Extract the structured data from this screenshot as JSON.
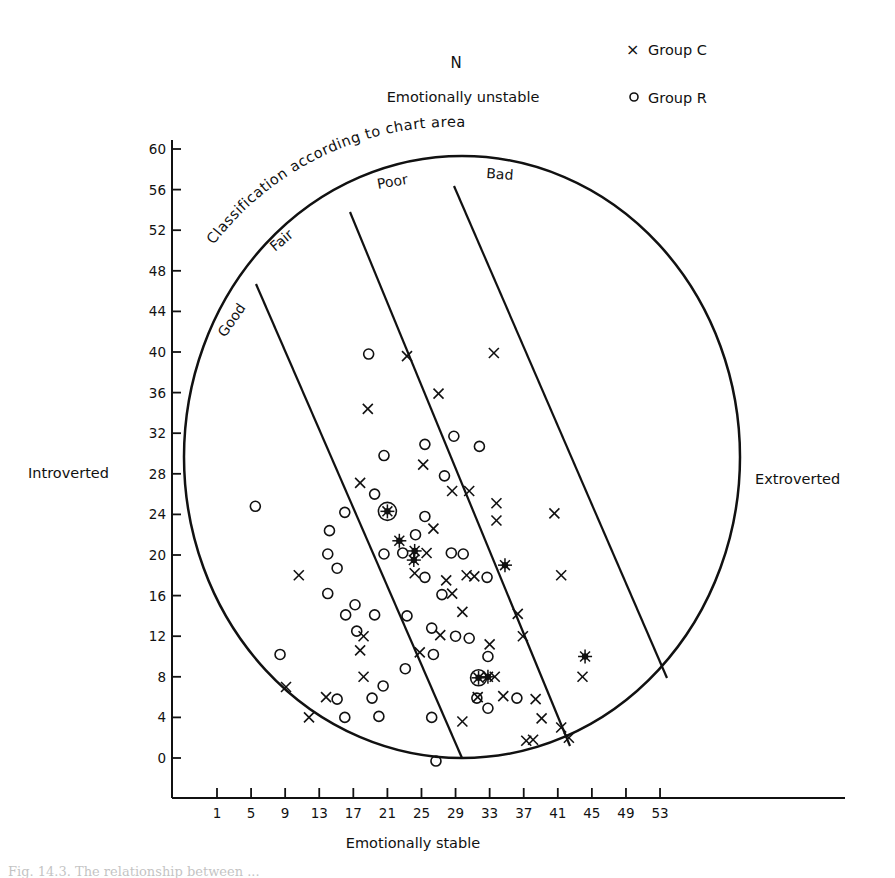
{
  "chart_data": {
    "type": "scatter",
    "title": "Classification according to chart area",
    "top_labels": {
      "n": "N",
      "top_axis": "Emotionally unstable"
    },
    "xlabel": "Emotionally stable",
    "left_label": "Introverted",
    "right_label": "Extroverted",
    "xlim": [
      -3,
      55
    ],
    "ylim": [
      -4,
      61
    ],
    "x_ticks": [
      1,
      5,
      9,
      13,
      17,
      21,
      25,
      29,
      33,
      37,
      41,
      45,
      49,
      53
    ],
    "y_ticks": [
      0,
      4,
      8,
      12,
      16,
      20,
      24,
      28,
      32,
      36,
      40,
      44,
      48,
      52,
      56,
      60
    ],
    "grid": false,
    "legend": {
      "position": "top-right",
      "entries": [
        {
          "marker": "×",
          "label": "Group C"
        },
        {
          "marker": "○",
          "label": "Group R"
        }
      ]
    },
    "zones": [
      "Good",
      "Fair",
      "Poor",
      "Bad"
    ],
    "series": [
      {
        "name": "Group C",
        "marker": "x",
        "points": [
          [
            23.3,
            39.6
          ],
          [
            33.5,
            39.9
          ],
          [
            18.7,
            34.4
          ],
          [
            27.0,
            35.9
          ],
          [
            25.2,
            28.9
          ],
          [
            28.6,
            26.3
          ],
          [
            30.6,
            26.3
          ],
          [
            33.8,
            25.1
          ],
          [
            33.8,
            23.4
          ],
          [
            40.6,
            24.1
          ],
          [
            17.8,
            27.1
          ],
          [
            10.6,
            18.0
          ],
          [
            41.4,
            18.0
          ],
          [
            24.2,
            18.2
          ],
          [
            25.6,
            20.2
          ],
          [
            26.4,
            22.6
          ],
          [
            27.9,
            17.5
          ],
          [
            28.6,
            16.2
          ],
          [
            30.3,
            18.0
          ],
          [
            31.2,
            17.9
          ],
          [
            29.8,
            14.4
          ],
          [
            36.3,
            14.2
          ],
          [
            36.9,
            12.0
          ],
          [
            33.0,
            11.2
          ],
          [
            33.6,
            8.0
          ],
          [
            18.2,
            12.0
          ],
          [
            17.8,
            10.6
          ],
          [
            18.2,
            8.0
          ],
          [
            24.8,
            10.4
          ],
          [
            27.2,
            12.1
          ],
          [
            9.1,
            7.0
          ],
          [
            13.8,
            6.0
          ],
          [
            11.8,
            4.0
          ],
          [
            29.8,
            3.6
          ],
          [
            31.6,
            6.0
          ],
          [
            34.6,
            6.1
          ],
          [
            38.4,
            5.8
          ],
          [
            39.1,
            3.9
          ],
          [
            41.4,
            3.0
          ],
          [
            42.3,
            2.0
          ],
          [
            43.9,
            8.0
          ],
          [
            37.3,
            1.7
          ],
          [
            38.1,
            1.8
          ]
        ]
      },
      {
        "name": "Group R",
        "marker": "o",
        "points": [
          [
            18.8,
            39.8
          ],
          [
            25.4,
            30.9
          ],
          [
            28.8,
            31.7
          ],
          [
            31.8,
            30.7
          ],
          [
            20.6,
            29.8
          ],
          [
            19.5,
            26.0
          ],
          [
            27.7,
            27.8
          ],
          [
            5.5,
            24.8
          ],
          [
            16.0,
            24.2
          ],
          [
            14.2,
            22.4
          ],
          [
            25.4,
            23.8
          ],
          [
            24.3,
            22.0
          ],
          [
            14.0,
            20.1
          ],
          [
            20.6,
            20.1
          ],
          [
            22.8,
            20.2
          ],
          [
            25.4,
            17.8
          ],
          [
            28.5,
            20.2
          ],
          [
            29.9,
            20.1
          ],
          [
            32.7,
            17.8
          ],
          [
            15.1,
            18.7
          ],
          [
            14.0,
            16.2
          ],
          [
            16.1,
            14.1
          ],
          [
            17.2,
            15.1
          ],
          [
            19.5,
            14.1
          ],
          [
            17.4,
            12.5
          ],
          [
            23.3,
            14.0
          ],
          [
            26.2,
            12.8
          ],
          [
            27.4,
            16.1
          ],
          [
            29.0,
            12.0
          ],
          [
            30.6,
            11.8
          ],
          [
            8.4,
            10.2
          ],
          [
            23.1,
            8.8
          ],
          [
            26.4,
            10.2
          ],
          [
            15.1,
            5.8
          ],
          [
            16.0,
            4.0
          ],
          [
            20.0,
            4.1
          ],
          [
            20.5,
            7.1
          ],
          [
            19.2,
            5.9
          ],
          [
            26.2,
            4.0
          ],
          [
            31.5,
            5.9
          ],
          [
            32.8,
            4.9
          ],
          [
            32.8,
            10.0
          ],
          [
            36.2,
            5.9
          ],
          [
            26.7,
            -0.3
          ]
        ]
      },
      {
        "name": "Coincident / multiple points",
        "marker": "special",
        "points": [
          [
            21.0,
            24.3
          ],
          [
            22.4,
            21.4
          ],
          [
            24.1,
            19.5
          ],
          [
            24.2,
            20.4
          ],
          [
            34.8,
            19.0
          ],
          [
            31.7,
            7.9
          ],
          [
            32.8,
            8.0
          ],
          [
            44.2,
            10.0
          ]
        ]
      }
    ]
  },
  "caption_fragment": "Fig. 14.3. The relationship between ..."
}
